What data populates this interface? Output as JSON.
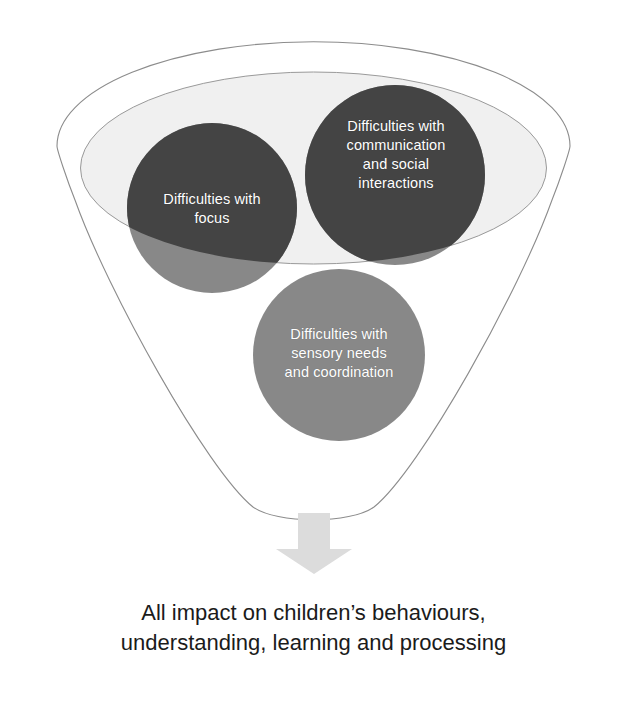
{
  "diagram": {
    "type": "funnel",
    "title_caption": "All impact on children’s behaviours,\nunderstanding, learning and processing",
    "bubbles": [
      {
        "id": "focus",
        "label": "Difficulties with\nfocus",
        "color_top": "#444444",
        "color_bottom": "#888888"
      },
      {
        "id": "communication",
        "label": "Difficulties with\ncommunication\nand social\ninteractions",
        "color_top": "#444444",
        "color_bottom": "#888888"
      },
      {
        "id": "sensory",
        "label": "Difficulties with\nsensory needs\nand coordination",
        "color_top": "#888888",
        "color_bottom": "#888888"
      }
    ],
    "arrow": {
      "name": "down-arrow",
      "color": "#dcdcdc"
    },
    "colors": {
      "funnel_outline": "#8c8c8c",
      "funnel_inner_fill": "#f0f0f0",
      "funnel_body_fill": "#ffffff",
      "bubble_dark": "#444444",
      "bubble_light": "#888888",
      "caption_text": "#1b1b1b",
      "background": "#ffffff"
    }
  }
}
